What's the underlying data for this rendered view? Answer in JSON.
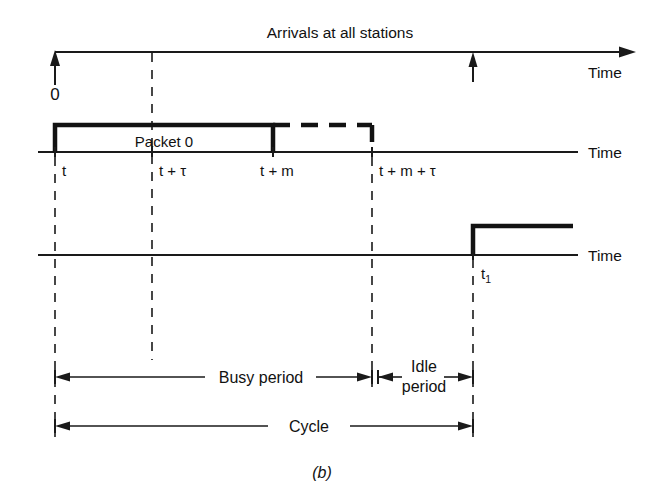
{
  "figure": {
    "caption": "(b)",
    "top_axis": {
      "title": "Arrivals at all stations",
      "axis_label": "Time",
      "origin_label": "0",
      "arrival_marks": [
        "0",
        "t1"
      ]
    },
    "middle_axis": {
      "axis_label": "Time",
      "packet_label": "Packet 0",
      "tick_labels": [
        {
          "id": "t",
          "text": "t"
        },
        {
          "id": "t_plus_tau",
          "text": "t + τ"
        },
        {
          "id": "t_plus_m",
          "text": "t + m"
        },
        {
          "id": "t_plus_m_plus_tau",
          "text": "t + m + τ"
        }
      ]
    },
    "bottom_axis": {
      "axis_label": "Time",
      "tick_label_base": "t",
      "tick_label_sub": "1"
    },
    "dimensions": [
      {
        "id": "busy-period",
        "label": "Busy period"
      },
      {
        "id": "idle-period",
        "label_line1": "Idle",
        "label_line2": "period"
      },
      {
        "id": "cycle",
        "label": "Cycle"
      }
    ],
    "colors": {
      "ink": "#111111",
      "background": "#ffffff"
    }
  }
}
